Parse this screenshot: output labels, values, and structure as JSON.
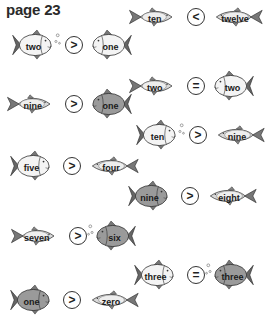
{
  "page": {
    "title": "page 23"
  },
  "comparisons": [
    {
      "id": "c1",
      "left": "two",
      "symbol": ">",
      "right": "one",
      "x": 8,
      "y": 45,
      "lf": "round-bubbles",
      "rf": "round"
    },
    {
      "id": "c2",
      "left": "nine",
      "symbol": ">",
      "right": "one",
      "x": 2,
      "y": 104,
      "lf": "slim",
      "rf": "round-dark"
    },
    {
      "id": "c3",
      "left": "five",
      "symbol": ">",
      "right": "four",
      "x": 6,
      "y": 166,
      "lf": "round",
      "rf": "slim"
    },
    {
      "id": "c4",
      "left": "seven",
      "symbol": ">",
      "right": "six",
      "x": 6,
      "y": 236,
      "lf": "slim",
      "rf": "round-bubbles-dark"
    },
    {
      "id": "c5",
      "left": "one",
      "symbol": ">",
      "right": "zero",
      "x": 6,
      "y": 300,
      "lf": "round-dark",
      "rf": "slim"
    },
    {
      "id": "c6",
      "left": "ten",
      "symbol": "<",
      "right": "twelve",
      "x": 124,
      "y": 17,
      "lf": "slim",
      "rf": "slim"
    },
    {
      "id": "c7",
      "left": "two",
      "symbol": "=",
      "right": "two",
      "x": 124,
      "y": 86,
      "lf": "slim",
      "rf": "round"
    },
    {
      "id": "c8",
      "left": "ten",
      "symbol": ">",
      "right": "nine",
      "x": 132,
      "y": 135,
      "lf": "round-bubbles",
      "rf": "slim"
    },
    {
      "id": "c9",
      "left": "nine",
      "symbol": ">",
      "right": "eight",
      "x": 124,
      "y": 196,
      "lf": "round-dark",
      "rf": "slim"
    },
    {
      "id": "c10",
      "left": "three",
      "symbol": "=",
      "right": "three",
      "x": 130,
      "y": 275,
      "lf": "round",
      "rf": "round-bubbles-dark"
    }
  ]
}
